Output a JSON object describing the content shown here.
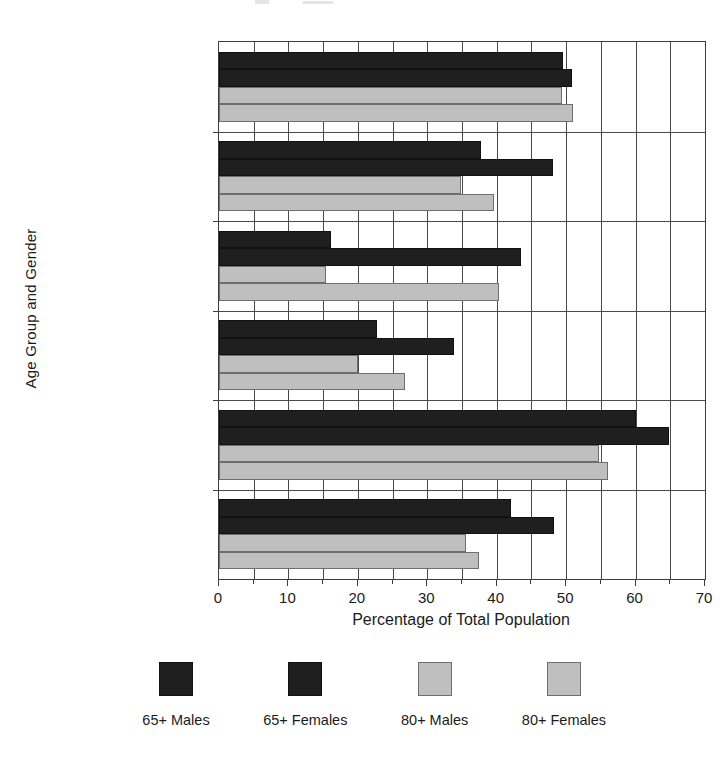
{
  "chart_data": {
    "type": "bar",
    "orientation": "horizontal",
    "title": "",
    "xlabel": "Percentage of Total Population",
    "ylabel": "Age Group and Gender",
    "xlim": [
      0,
      70
    ],
    "xticks": [
      0,
      10,
      20,
      30,
      40,
      50,
      60,
      70
    ],
    "xtick_labels": [
      "0",
      "10",
      "20",
      "30",
      "40",
      "50",
      "60",
      "70"
    ],
    "minor_tick_step": 5,
    "grid": "vertical-major-and-minor",
    "legend_position": "below-axes",
    "categories": [
      "Watch television",
      "Listen to radio",
      "Talk on phone",
      "Arts & crafts",
      "Read",
      "Have family/friends over"
    ],
    "series": [
      {
        "name": "65+ Males",
        "color": "#1f1f1f",
        "values": [
          49.5,
          37.8,
          16.1,
          22.8,
          60.1,
          42.1
        ]
      },
      {
        "name": "65+ Females",
        "color": "#1f1f1f",
        "values": [
          50.9,
          48.1,
          43.5,
          33.9,
          64.8,
          48.3
        ]
      },
      {
        "name": "80+ Males",
        "color": "#bfbfbf",
        "values": [
          49.4,
          34.9,
          15.4,
          20.0,
          54.8,
          35.6
        ]
      },
      {
        "name": "80+ Females",
        "color": "#bfbfbf",
        "values": [
          51.0,
          39.6,
          40.3,
          26.8,
          56.0,
          37.5
        ]
      }
    ]
  },
  "legend": {
    "items": [
      {
        "label": "65+ Males",
        "swatch": "dark"
      },
      {
        "label": "65+ Females",
        "swatch": "dark"
      },
      {
        "label": "80+ Males",
        "swatch": "light"
      },
      {
        "label": "80+ Females",
        "swatch": "light"
      }
    ]
  },
  "colors": {
    "dark": "#1f1f1f",
    "light": "#bfbfbf",
    "axis": "#3c3c3c",
    "text": "#1b1b1b",
    "background": "#ffffff"
  }
}
